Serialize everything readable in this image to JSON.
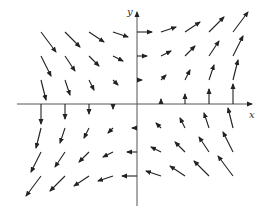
{
  "diagram": {
    "type": "vector_field",
    "field": {
      "fx": "y",
      "fy": "x"
    },
    "axes": {
      "x_label": "x",
      "y_label": "y",
      "origin_px": [
        137,
        104
      ],
      "x_range_px": [
        17,
        258
      ],
      "y_range_px": [
        8,
        206
      ]
    },
    "grid": {
      "columns": [
        -4,
        -3,
        -2,
        -1,
        0,
        1,
        2,
        3,
        4
      ],
      "rows": [
        3,
        2,
        1,
        0,
        -1,
        -2,
        -3
      ],
      "spacing_px": 24,
      "arrow_scale_px_per_unit": 5
    },
    "colors": {
      "background": "#ffffff",
      "arrow": "#222222",
      "axis": "#555555"
    }
  }
}
